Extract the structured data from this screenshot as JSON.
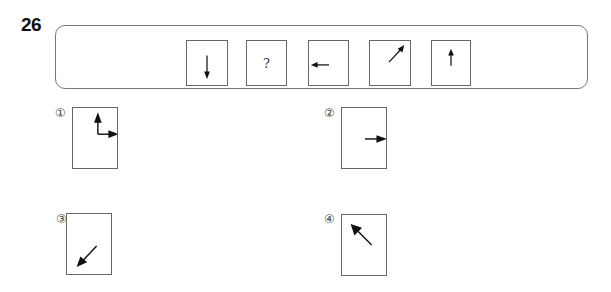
{
  "question": {
    "number": "26",
    "sequence": [
      {
        "type": "arrow",
        "direction": "down",
        "label": ""
      },
      {
        "type": "unknown",
        "direction": "",
        "label": "?"
      },
      {
        "type": "arrow",
        "direction": "left",
        "label": ""
      },
      {
        "type": "arrow",
        "direction": "up-right",
        "label": ""
      },
      {
        "type": "arrow",
        "direction": "up",
        "label": ""
      }
    ]
  },
  "options": [
    {
      "label": "①",
      "content": "two arrows: up and right (L-shape)"
    },
    {
      "label": "②",
      "content": "arrow right"
    },
    {
      "label": "③",
      "content": "arrow down-left"
    },
    {
      "label": "④",
      "content": "arrow up-left"
    }
  ]
}
